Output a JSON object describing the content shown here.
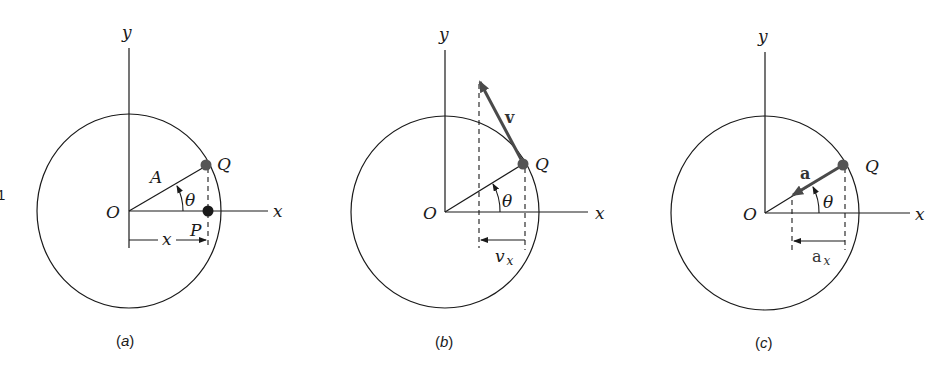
{
  "figure": {
    "edge_fragment": "1",
    "panels": [
      {
        "id": "a",
        "caption_open": "(",
        "caption_letter": "a",
        "caption_close": ")",
        "labels": {
          "y_axis": "y",
          "x_axis": "x",
          "origin": "O",
          "point_q": "Q",
          "point_p": "P",
          "radius": "A",
          "angle": "θ",
          "displacement": "x"
        }
      },
      {
        "id": "b",
        "caption_open": "(",
        "caption_letter": "b",
        "caption_close": ")",
        "labels": {
          "y_axis": "y",
          "x_axis": "x",
          "origin": "O",
          "point_q": "Q",
          "angle": "θ",
          "vector": "v",
          "component": "v",
          "component_sub": "x"
        }
      },
      {
        "id": "c",
        "caption_open": "(",
        "caption_letter": "c",
        "caption_close": ")",
        "labels": {
          "y_axis": "y",
          "x_axis": "x",
          "origin": "O",
          "point_q": "Q",
          "angle": "θ",
          "vector": "a",
          "component": "a",
          "component_sub": "x"
        }
      }
    ],
    "colors": {
      "line": "#1a1a1a",
      "vector": "#4a4a4a",
      "dot": "#555555",
      "background": "#ffffff"
    }
  }
}
